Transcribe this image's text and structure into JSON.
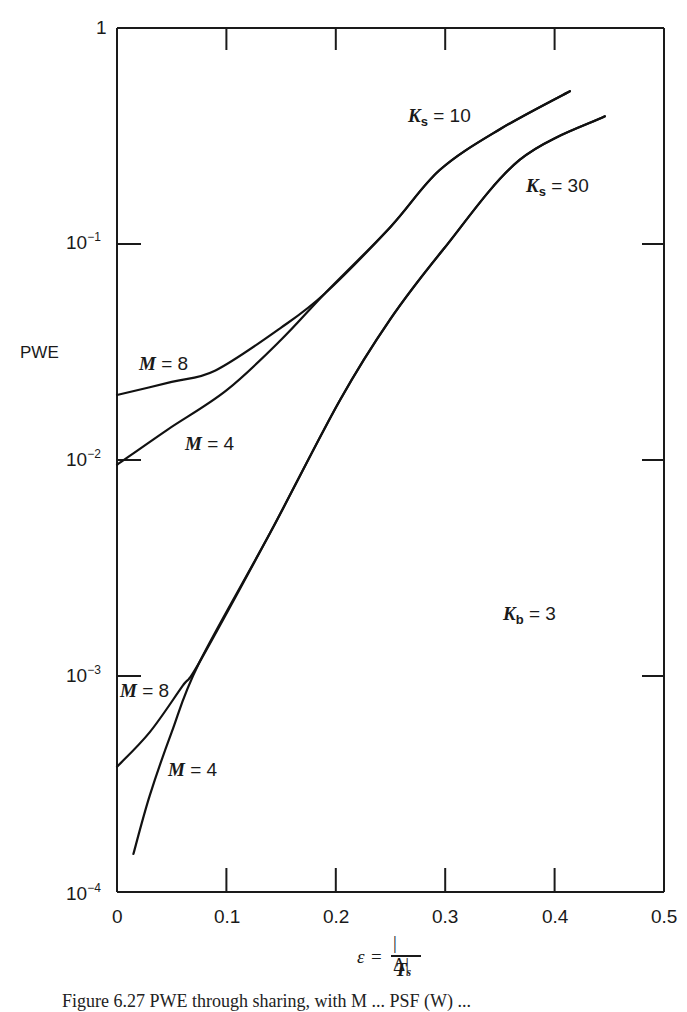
{
  "chart_data": {
    "type": "line",
    "title": "",
    "xlabel": "ε = |Δ| / T_s",
    "ylabel": "PWE",
    "xscale": "linear",
    "yscale": "log",
    "xlim": [
      0,
      0.5
    ],
    "ylim": [
      0.0001,
      1
    ],
    "xticks": [
      "0",
      "0.1",
      "0.2",
      "0.3",
      "0.4",
      "0.5"
    ],
    "yticks": [
      "1",
      "10^-1",
      "10^-2",
      "10^-3",
      "10^-4"
    ],
    "grid": false,
    "annotations": [
      "K_s = 10",
      "K_s = 30",
      "K_b = 3",
      "M = 8",
      "M = 4",
      "M = 8",
      "M = 4"
    ],
    "series": [
      {
        "name": "K_s = 10, M = 8",
        "x": [
          0,
          0.05,
          0.09,
          0.15,
          0.19,
          0.25,
          0.295,
          0.35,
          0.414
        ],
        "y": [
          0.02,
          0.023,
          0.026,
          0.041,
          0.059,
          0.12,
          0.22,
          0.34,
          0.51
        ]
      },
      {
        "name": "K_s = 10, M = 4",
        "x": [
          0,
          0.046,
          0.1,
          0.15,
          0.19,
          0.25,
          0.295,
          0.35,
          0.414
        ],
        "y": [
          0.0095,
          0.0138,
          0.021,
          0.036,
          0.059,
          0.12,
          0.22,
          0.34,
          0.51
        ]
      },
      {
        "name": "K_s = 30, M = 8",
        "x": [
          0,
          0.03,
          0.06,
          0.075,
          0.14,
          0.204,
          0.25,
          0.298,
          0.368,
          0.446
        ],
        "y": [
          0.00038,
          0.00055,
          0.0009,
          0.00115,
          0.0046,
          0.019,
          0.045,
          0.094,
          0.245,
          0.39
        ]
      },
      {
        "name": "K_s = 30, M = 4",
        "x": [
          0.015,
          0.03,
          0.05,
          0.075,
          0.14,
          0.204,
          0.25,
          0.298,
          0.368,
          0.446
        ],
        "y": [
          0.00015,
          0.00028,
          0.00055,
          0.00115,
          0.0046,
          0.019,
          0.045,
          0.094,
          0.245,
          0.39
        ]
      }
    ]
  },
  "axes": {
    "y_label": "PWE",
    "y_ticks": [
      "1",
      "10",
      "10",
      "10",
      "10"
    ],
    "y_tick_exp": [
      "",
      "−1",
      "−2",
      "−3",
      "−4"
    ],
    "x_ticks": [
      "0",
      "0.1",
      "0.2",
      "0.3",
      "0.4",
      "0.5"
    ],
    "x_label": {
      "eps": "ε",
      "eq": "=",
      "num": "|Δ|",
      "den": "T",
      "den_sub": "s"
    }
  },
  "labels": {
    "ks10": {
      "k": "K",
      "sub": "s",
      "rest": " = 10"
    },
    "ks30": {
      "k": "K",
      "sub": "s",
      "rest": " = 30"
    },
    "kb3": {
      "k": "K",
      "sub": "b",
      "rest": " = 3"
    },
    "m8_upper": {
      "m": "M",
      "rest": " = 8"
    },
    "m4_upper": {
      "m": "M",
      "rest": " = 4"
    },
    "m8_lower": {
      "m": "M",
      "rest": " = 8"
    },
    "m4_lower": {
      "m": "M",
      "rest": " = 4"
    }
  },
  "caption": "Figure 6.27  PWE through sharing, with M ... PSF (W) ..."
}
